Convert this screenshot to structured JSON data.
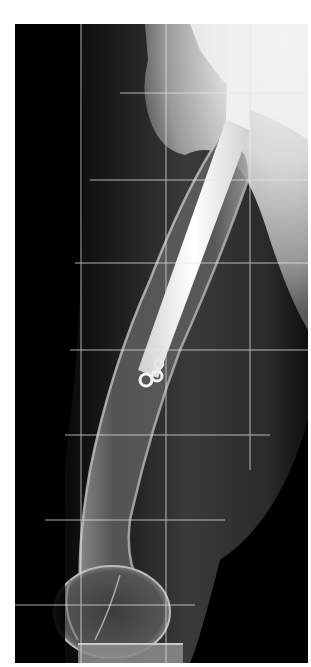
{
  "image": {
    "type": "radiograph",
    "subject": "femur lateral view with intramedullary nail",
    "description": "X-ray of a femur with an intramedullary rod and distal locking screws, overlaid with a measurement grid",
    "background_color": "#ffffff",
    "film_color": "#000000",
    "grid_color": "#e6e6e6",
    "grid": {
      "vertical_x": [
        81,
        166,
        250
      ],
      "horizontal_y": [
        93,
        180,
        263,
        350,
        435,
        520,
        605
      ]
    },
    "visible_text": []
  }
}
